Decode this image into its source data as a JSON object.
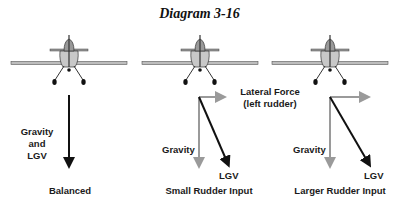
{
  "title": "Diagram 3-16",
  "panels": [
    {
      "caption": "Balanced",
      "vector_label": [
        "Gravity",
        "and",
        "LGV"
      ]
    },
    {
      "caption": "Small Rudder Input",
      "gravity_label": "Gravity",
      "lgv_label": "LGV",
      "lateral_label": [
        "Lateral Force",
        "(left rudder)"
      ]
    },
    {
      "caption": "Larger Rudder Input",
      "gravity_label": "Gravity",
      "lgv_label": "LGV"
    }
  ],
  "colors": {
    "resultant": "#111111",
    "component": "#9a9a9a",
    "aircraft_fill": "#c8c8c8",
    "aircraft_line": "#333333"
  }
}
